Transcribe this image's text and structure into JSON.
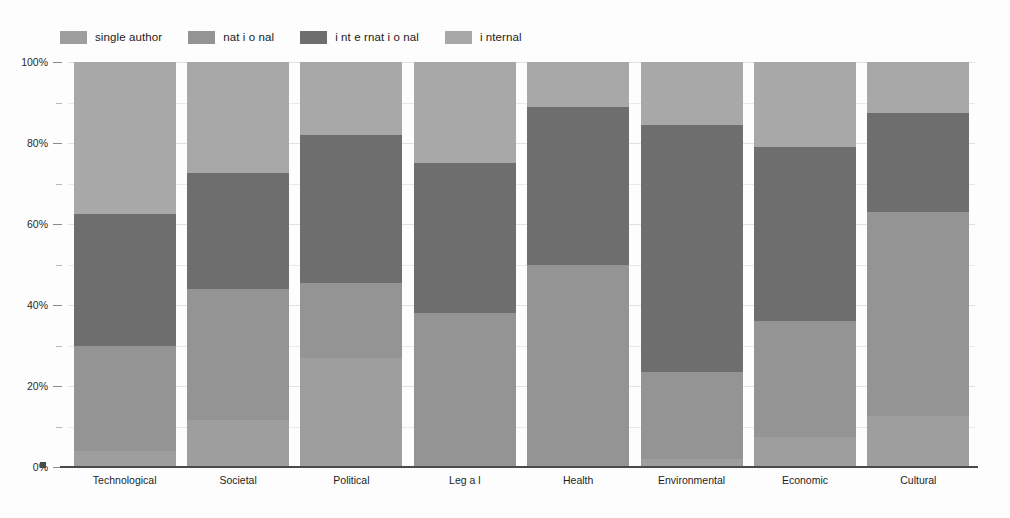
{
  "chart_data": {
    "type": "bar",
    "subtype": "stacked-percentage",
    "title": "",
    "xlabel": "",
    "ylabel": "",
    "ylim": [
      0,
      100
    ],
    "grid": true,
    "legend_position": "top-left",
    "categories": [
      "Technological",
      "Societal",
      "Political",
      "Leg a l",
      "Health",
      "Environmental",
      "Economic",
      "Cultural"
    ],
    "tick_labels": [
      "0%",
      "20%",
      "40%",
      "60%",
      "80%",
      "100%"
    ],
    "tick_values": [
      0,
      20,
      40,
      60,
      80,
      100
    ],
    "minor_tick_values": [
      10,
      30,
      50,
      70,
      90
    ],
    "series": [
      {
        "name": "single author",
        "color": "#9e9e9e",
        "values": [
          4,
          11.5,
          27,
          0,
          0,
          2,
          7.5,
          12.5
        ]
      },
      {
        "name": "nat i o nal",
        "color": "#949494",
        "values": [
          26,
          32.5,
          18.5,
          38,
          50,
          21.5,
          28.5,
          50.5
        ]
      },
      {
        "name": "i nt e rnat i o nal",
        "color": "#6e6e6e",
        "values": [
          32.5,
          28.5,
          36.5,
          37,
          39,
          61,
          43,
          24.5
        ]
      },
      {
        "name": "i nternal",
        "color": "#a8a8a8",
        "values": [
          37.5,
          27.5,
          18,
          25,
          11,
          15.5,
          21,
          12.5
        ]
      }
    ],
    "cumulative_boundaries": {
      "Technological": [
        4,
        30,
        62.5,
        100
      ],
      "Societal": [
        11.5,
        44,
        72.5,
        100
      ],
      "Political": [
        27,
        45.5,
        82,
        100
      ],
      "Leg a l": [
        0,
        38,
        75,
        100
      ],
      "Health": [
        0,
        50,
        89,
        100
      ],
      "Environmental": [
        2,
        23.5,
        84.5,
        100
      ],
      "Economic": [
        7.5,
        36,
        79,
        100
      ],
      "Cultural": [
        12.5,
        63,
        87.5,
        100
      ]
    }
  },
  "legend": {
    "items": [
      {
        "label": "single author",
        "color": "#9e9e9e"
      },
      {
        "label": "nat i o nal",
        "color": "#949494"
      },
      {
        "label": "i nt e rnat i o nal",
        "color": "#6e6e6e"
      },
      {
        "label": "i nternal",
        "color": "#a8a8a8"
      }
    ]
  },
  "axes": {
    "y": {
      "ticks": [
        "0%",
        "20%",
        "40%",
        "60%",
        "80%",
        "100%"
      ]
    },
    "x": {
      "ticks": [
        "Technological",
        "Societal",
        "Political",
        "Leg a l",
        "Health",
        "Environmental",
        "Economic",
        "Cultural"
      ]
    }
  },
  "colors": {
    "single_author": "#9e9e9e",
    "national": "#949494",
    "international": "#6e6e6e",
    "internal": "#a8a8a8",
    "gridline": "#e9e9e9",
    "baseline": "#4a4a4a",
    "text": "#1d1d1d",
    "background": "#fdfdfd"
  }
}
